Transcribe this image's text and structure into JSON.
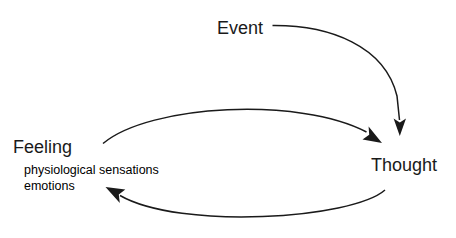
{
  "diagram": {
    "type": "cognitive-behavioural cycle",
    "background_color": "#ffffff",
    "stroke_color": "#1a1a1a",
    "text_color": "#1a1a1a",
    "nodes": {
      "event": {
        "label": "Event"
      },
      "thought": {
        "label": "Thought"
      },
      "feeling": {
        "label": "Feeling",
        "details": [
          "physiological sensations",
          "emotions"
        ]
      }
    },
    "arrows": [
      {
        "name": "event-to-thought",
        "from": "Event",
        "to": "Thought"
      },
      {
        "name": "feeling-to-thought",
        "from": "Feeling",
        "to": "Thought"
      },
      {
        "name": "thought-to-feeling",
        "from": "Thought",
        "to": "Feeling"
      }
    ]
  }
}
